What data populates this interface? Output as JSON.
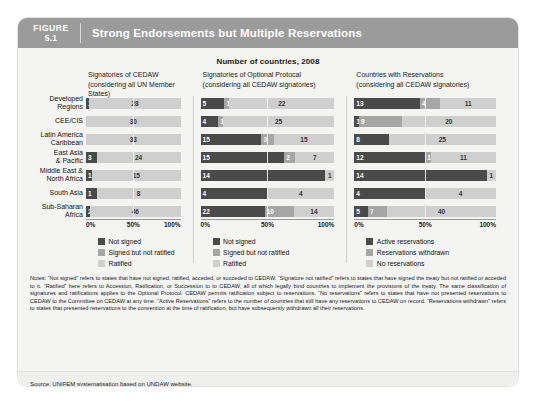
{
  "header": {
    "figure_word": "FIGURE",
    "figure_number": "5.1",
    "title": "Strong Endorsements but Multiple Reservations"
  },
  "chart_super_title": "Number of countries, 2008",
  "row_labels": [
    "Developed\nRegions",
    "CEE/CIS",
    "Latin America\nCaribbean",
    "East Asia\n& Pacific",
    "Middle East &\nNorth Africa",
    "South Asia",
    "Sub-Saharan\nAfrica"
  ],
  "axis": {
    "t0": "0%",
    "t50": "50%",
    "t100": "100%"
  },
  "colors": {
    "dark": "#4a4a4a",
    "mid": "#a6a6a6",
    "light": "#cfcfcf",
    "header_band": "#9b9b9b",
    "card_bg": "#f4f4f2"
  },
  "panels": [
    {
      "title_line1": "Signatories of CEDAW",
      "title_line2": "(considering all UN Member States)",
      "legend": [
        "Not signed",
        "Signed but not ratified",
        "Ratified"
      ]
    },
    {
      "title_line1": "Signatories of Optional Protocal",
      "title_line2": "(considering all CEDAW signatories)",
      "legend": [
        "Not signed",
        "Signed but not ratified",
        "Ratified"
      ]
    },
    {
      "title_line1": "Countries with Reservations",
      "title_line2": "(considering all CEDAW signatories)",
      "legend": [
        "Active reservations",
        "Reservations withdrawn",
        "No reservations"
      ]
    }
  ],
  "notes_label": "Notes:",
  "notes": "Notes: “Not signed” refers to states that have not signed, ratified, acceded, or succeded to CEDAW. “Signature not ratified” refers to states that have signed the treaty but not ratified or acceded to it. “Ratified” here refers to Accession, Ratification, or Succession to to CEDAW, all of which legally bind countries to implement the provisions of the treaty. The same classification of signatures and ratifications applies to the Optional Protocol. CEDAW permits ratification subject to reservations. “No reservations” refers to states that have not presented reservations to CEDAW to the Committee on CEDAW at any time. “Active Reservations” refers to the number of countries that still have any reservations to CEDAW on record. “Reservations withdrawn” refers to states that presented reservations to the convention at the time of ratification, but have subsequently withdrawn all their reservations.",
  "source": "Source: UNIFEM systematisation based on UNDAW website.",
  "chart_data": {
    "type": "bar",
    "title": "Strong Endorsements but Multiple Reservations",
    "subtitle": "Number of countries, 2008",
    "orientation": "horizontal",
    "stacked": true,
    "normalized_percent": true,
    "xlabel": "",
    "ylabel": "",
    "xlim": [
      0,
      100
    ],
    "xticks": [
      "0%",
      "50%",
      "100%"
    ],
    "grid": false,
    "legend_position": "below-each-panel",
    "categories": [
      "Developed Regions",
      "CEE/CIS",
      "Latin America Caribbean",
      "East Asia & Pacific",
      "Middle East & North Africa",
      "South Asia",
      "Sub-Saharan Africa"
    ],
    "panels": [
      {
        "name": "Signatories of CEDAW (considering all UN Member States)",
        "series": [
          {
            "name": "Not signed",
            "color": "#4a4a4a",
            "values": [
              1,
              0,
              0,
              3,
              1,
              1,
              2
            ]
          },
          {
            "name": "Signed but not ratified",
            "color": "#a6a6a6",
            "values": [
              0,
              0,
              0,
              0,
              0,
              0,
              0
            ]
          },
          {
            "name": "Ratified",
            "color": "#cfcfcf",
            "values": [
              28,
              30,
              33,
              24,
              15,
              8,
              46
            ]
          }
        ]
      },
      {
        "name": "Signatories of Optional Protocal (considering all CEDAW signatories)",
        "series": [
          {
            "name": "Not signed",
            "color": "#4a4a4a",
            "values": [
              5,
              4,
              15,
              15,
              14,
              4,
              22
            ]
          },
          {
            "name": "Signed but not ratified",
            "color": "#a6a6a6",
            "values": [
              1,
              1,
              3,
              2,
              0,
              0,
              10
            ]
          },
          {
            "name": "Ratified",
            "color": "#cfcfcf",
            "values": [
              22,
              25,
              15,
              7,
              1,
              4,
              14
            ]
          }
        ]
      },
      {
        "name": "Countries with Reservations (considering all CEDAW signatories)",
        "series": [
          {
            "name": "Active reservations",
            "color": "#4a4a4a",
            "values": [
              13,
              1,
              8,
              12,
              14,
              4,
              5
            ]
          },
          {
            "name": "Reservations withdrawn",
            "color": "#a6a6a6",
            "values": [
              4,
              9,
              0,
              1,
              0,
              0,
              7
            ]
          },
          {
            "name": "No reservations",
            "color": "#cfcfcf",
            "values": [
              11,
              20,
              25,
              11,
              1,
              4,
              40
            ]
          }
        ]
      }
    ]
  }
}
